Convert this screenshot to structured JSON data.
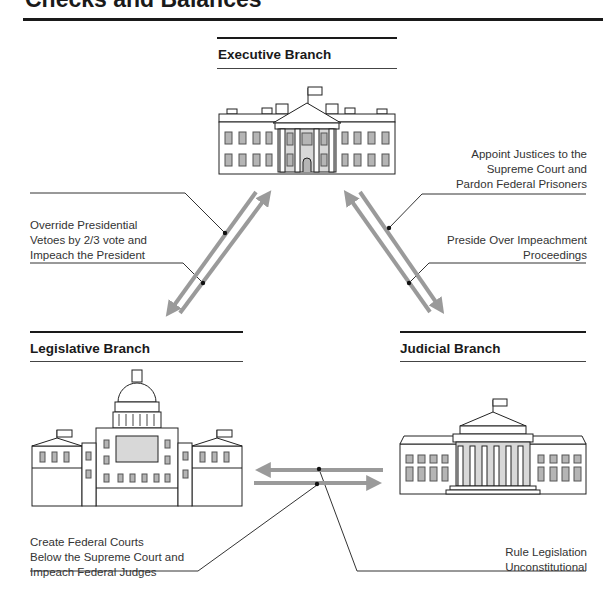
{
  "title": "Checks and Balances",
  "branches": {
    "executive": {
      "heading": "Executive Branch",
      "icon": "white-house-icon"
    },
    "legislative": {
      "heading": "Legislative Branch",
      "icon": "capitol-building-icon"
    },
    "judicial": {
      "heading": "Judicial Branch",
      "icon": "supreme-court-icon"
    }
  },
  "checks": {
    "legislative_on_executive": [
      "Override Presidential",
      "Vetoes by 2/3 vote and",
      "Impeach the President"
    ],
    "executive_on_judicial": [
      "Appoint Justices to the",
      "Supreme Court and",
      "Pardon Federal Prisoners"
    ],
    "judicial_on_executive": [
      "Preside Over Impeachment",
      "Proceedings"
    ],
    "legislative_on_judicial": [
      "Create Federal Courts",
      "Below the Supreme Court and",
      "Impeach Federal Judges"
    ],
    "judicial_on_legislative": [
      "Rule Legislation",
      "Unconstitutional"
    ]
  },
  "colors": {
    "arrow": "#9a9a9a",
    "ink": "#1a1a1a",
    "window": "#b5b5b5"
  }
}
